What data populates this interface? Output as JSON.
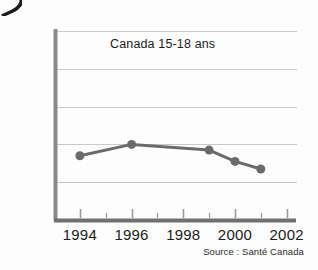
{
  "figure": {
    "background_color": "#fdfdfd",
    "corner_artifact": "page-curl-wedge"
  },
  "chart_data": {
    "type": "line",
    "title": "Canada 15-18 ans",
    "subtitle": "",
    "xlabel": "",
    "ylabel": "",
    "source_note": "Source : Santé Canada",
    "x": [
      1994,
      1996,
      1999,
      2000,
      2001
    ],
    "values": [
      27,
      30,
      28.5,
      25.5,
      23.5
    ],
    "series": [
      {
        "name": "Canada 15-18 ans",
        "x": [
          1994,
          1996,
          1999,
          2000,
          2001
        ],
        "values": [
          27,
          30,
          28.5,
          25.5,
          23.5
        ],
        "color": "#6b6b6b",
        "marker": "circle",
        "marker_size": 9,
        "line_width": 3
      }
    ],
    "xlim": [
      1993,
      2002.4
    ],
    "ylim": [
      10,
      60
    ],
    "xticks": [
      1994,
      1996,
      1998,
      2000,
      2002
    ],
    "xtick_labels": [
      "1994",
      "1996",
      "1998",
      "2000",
      "2002"
    ],
    "xminor_ticks": [
      1993,
      1995,
      1997,
      1999,
      2001
    ],
    "yticks": [
      10,
      20,
      30,
      40,
      50,
      60
    ],
    "ytick_labels": [
      "10 %",
      "20 %",
      "30 %",
      "40 %",
      "50 %",
      "60 %"
    ],
    "grid": "horizontal",
    "grid_color": "#c9c9c9",
    "axis_color": "#6f6f6f",
    "legend": "none",
    "legend_position": "none"
  },
  "axes": {
    "y_ticks": [
      {
        "label": "60 %",
        "value": 60
      },
      {
        "label": "50 %",
        "value": 50
      },
      {
        "label": "40 %",
        "value": 40
      },
      {
        "label": "30 %",
        "value": 30
      },
      {
        "label": "20 %",
        "value": 20
      },
      {
        "label": "10 %",
        "value": 10
      }
    ],
    "x_ticks": [
      {
        "label": "1994",
        "value": 1994
      },
      {
        "label": "1996",
        "value": 1996
      },
      {
        "label": "1998",
        "value": 1998
      },
      {
        "label": "2000",
        "value": 2000
      },
      {
        "label": "2002",
        "value": 2002
      }
    ]
  }
}
